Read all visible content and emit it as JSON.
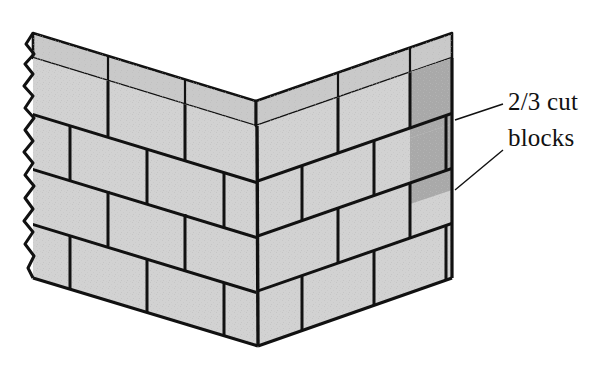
{
  "figure": {
    "name": "masonry-wall-corner-isometric",
    "background_color": "#ffffff"
  },
  "annotations": {
    "callout": {
      "name": "two-thirds-cut-blocks-callout",
      "line1": "2/3 cut",
      "line2": "blocks",
      "text_color": "#111111",
      "leader_count": 2
    }
  },
  "palette": {
    "block_face_light": "#d2d2d2",
    "block_face_cut": "#a9a9a9",
    "block_top_light": "#c9c9c9",
    "block_top_cut": "#b4b4b4",
    "outline": "#111111",
    "mortar_line": "#111111",
    "texture_speckle": "#bdbdbd"
  },
  "geometry": {
    "corner_apex_top_x": 256,
    "corner_apex_top_y": 126,
    "corner_apex_bottom_x": 258,
    "corner_apex_bottom_y": 346,
    "left_wall_end_x": 30,
    "right_wall_end_x": 452,
    "course_count": 4,
    "left_wall_edge": "broken-jagged",
    "right_wall_edge": "straight-cut"
  },
  "parts": {
    "left_wall": {
      "name": "left-wall-leaf",
      "course_labels": [
        "course-1-top",
        "course-2",
        "course-3",
        "course-4-bottom"
      ],
      "cut_blocks": 0
    },
    "right_wall": {
      "name": "right-wall-leaf",
      "course_labels": [
        "course-1-top",
        "course-2",
        "course-3",
        "course-4-bottom"
      ],
      "cut_blocks": 2,
      "cut_block_position": "right-end"
    },
    "top_cap": {
      "name": "wall-top-surface",
      "visible": true
    }
  }
}
